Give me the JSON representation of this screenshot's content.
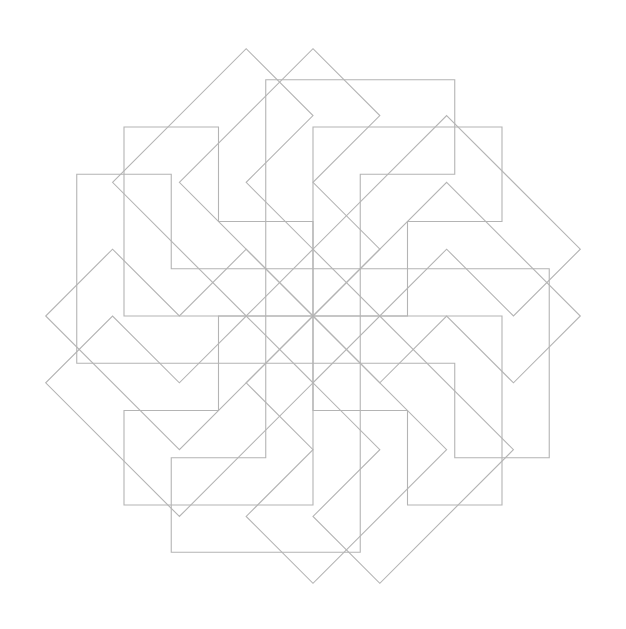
{
  "figure": {
    "width": 626,
    "height": 629,
    "background": "#ffffff",
    "stroke_color": "#b4b4b4",
    "stroke_width": 1.1
  },
  "pattern": {
    "description": "Rosette of 16 L-shaped outlines with 8-fold rotational symmetry",
    "center": [
      313,
      316
    ],
    "unit": 94.5,
    "rotation_step_deg": 45,
    "rotation_count": 8,
    "base_shape_units": [
      [
        0,
        -2
      ],
      [
        2,
        -2
      ],
      [
        2,
        -1
      ],
      [
        1,
        -1
      ],
      [
        1,
        0
      ],
      [
        0,
        0
      ]
    ],
    "copies": [
      {
        "name": "inner-l",
        "offset_units": [
          0,
          0
        ]
      },
      {
        "name": "outer-l",
        "offset_units": [
          -0.5,
          -0.5
        ]
      }
    ]
  }
}
